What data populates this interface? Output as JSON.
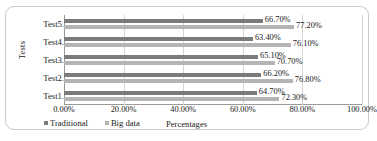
{
  "chart_data": {
    "type": "bar",
    "orientation": "horizontal",
    "title": "",
    "xlabel": "Percentages",
    "ylabel": "Tests",
    "categories": [
      "Test1.",
      "Test2.",
      "Test3.",
      "Test4.",
      "Test5."
    ],
    "series": [
      {
        "name": "Traditional",
        "color": "#7b7b7b",
        "values": [
          64.7,
          66.2,
          65.1,
          63.4,
          66.7
        ],
        "labels": [
          "64.70%",
          "66.20%",
          "65.10%",
          "63.40%",
          "66.70%"
        ]
      },
      {
        "name": "Big data",
        "color": "#b4b4b4",
        "values": [
          72.3,
          76.8,
          70.7,
          76.1,
          77.2
        ],
        "labels": [
          "72.30%",
          "76.80%",
          "70.70%",
          "76.10%",
          "77.20%"
        ]
      }
    ],
    "xlim": [
      0,
      100
    ],
    "xticks": [
      0,
      20,
      40,
      60,
      80,
      100
    ],
    "xtick_labels": [
      "0.00%",
      "20.00%",
      "40.00%",
      "60.00%",
      "80.00%",
      "100.00%"
    ],
    "grid": true,
    "legend_position": "bottom-left"
  }
}
